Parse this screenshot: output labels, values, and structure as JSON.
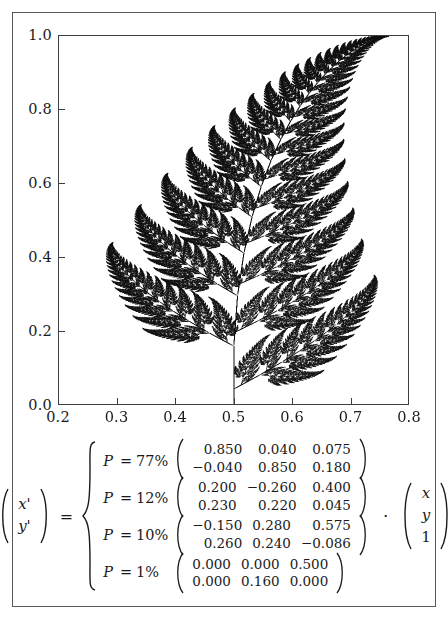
{
  "figure": {
    "background_color": "#ffffff",
    "frame_color": "#555a5e",
    "ink_color": "#111111"
  },
  "chart_data": {
    "type": "scatter",
    "title": "",
    "subtitle": "",
    "xlabel": "",
    "ylabel": "",
    "xlim": [
      0.2,
      0.8
    ],
    "ylim": [
      0.0,
      1.0
    ],
    "xticks": [
      0.2,
      0.3,
      0.4,
      0.5,
      0.6,
      0.7,
      0.8
    ],
    "yticks": [
      0.0,
      0.2,
      0.4,
      0.6,
      0.8,
      1.0
    ],
    "xtick_labels": [
      "0.2",
      "0.3",
      "0.4",
      "0.5",
      "0.6",
      "0.7",
      "0.8"
    ],
    "ytick_labels": [
      "0.0",
      "0.2",
      "0.4",
      "0.6",
      "0.8",
      "1.0"
    ],
    "grid": false,
    "legend": false,
    "point_color": "#111111",
    "ifs": {
      "probabilities": [
        0.77,
        0.12,
        0.1,
        0.01
      ],
      "maps": [
        {
          "a": 0.85,
          "b": 0.04,
          "e": 0.075,
          "c": -0.04,
          "d": 0.85,
          "f": 0.18
        },
        {
          "a": 0.2,
          "b": -0.26,
          "e": 0.4,
          "c": 0.23,
          "d": 0.22,
          "f": 0.045
        },
        {
          "a": -0.15,
          "b": 0.28,
          "e": 0.575,
          "c": 0.26,
          "d": 0.24,
          "f": -0.086
        },
        {
          "a": 0.0,
          "b": 0.0,
          "e": 0.5,
          "c": 0.0,
          "d": 0.16,
          "f": 0.0
        }
      ]
    }
  },
  "equation": {
    "lhs_vector": [
      "x'",
      "y'"
    ],
    "equals": "=",
    "dot_operator": "·",
    "rhs_vector": [
      "x",
      "y",
      "1"
    ],
    "cases": [
      {
        "probability_label": "P = 77%",
        "prob_symbol": "P",
        "prob_equals": "=",
        "prob_value": "77%",
        "matrix": [
          [
            "0.850",
            "0.040",
            "0.075"
          ],
          [
            "−0.040",
            "0.850",
            "0.180"
          ]
        ]
      },
      {
        "probability_label": "P = 12%",
        "prob_symbol": "P",
        "prob_equals": "=",
        "prob_value": "12%",
        "matrix": [
          [
            "0.200",
            "−0.260",
            "0.400"
          ],
          [
            "0.230",
            "0.220",
            "0.045"
          ]
        ]
      },
      {
        "probability_label": "P = 10%",
        "prob_symbol": "P",
        "prob_equals": "=",
        "prob_value": "10%",
        "matrix": [
          [
            "−0.150",
            "0.280",
            "0.575"
          ],
          [
            "0.260",
            "0.240",
            "−0.086"
          ]
        ]
      },
      {
        "probability_label": "P = 1%",
        "prob_symbol": "P",
        "prob_equals": "=",
        "prob_value": "1%",
        "matrix": [
          [
            "0.000",
            "0.000",
            "0.500"
          ],
          [
            "0.000",
            "0.160",
            "0.000"
          ]
        ]
      }
    ]
  },
  "caption_sliver": ""
}
